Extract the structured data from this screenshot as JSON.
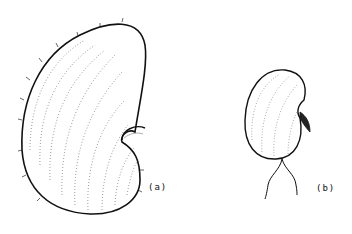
{
  "figure": {
    "panels": [
      {
        "id": "a",
        "label": "(a)",
        "subject": "large seed illustration"
      },
      {
        "id": "b",
        "label": "(b)",
        "subject": "small seed illustration with tendrils"
      }
    ],
    "colors": {
      "ink": "#111111",
      "background": "#ffffff"
    }
  }
}
